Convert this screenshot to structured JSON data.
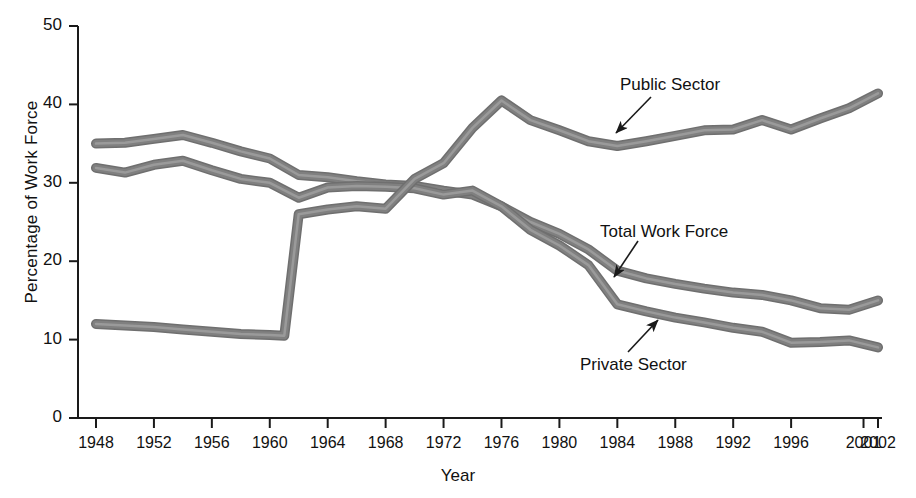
{
  "chart_data": {
    "type": "line",
    "title": "",
    "xlabel": "Year",
    "ylabel": "Percentage of Work Force",
    "ylim": [
      0,
      50
    ],
    "xlim": [
      1948,
      2002
    ],
    "yticks": [
      0,
      10,
      20,
      30,
      40,
      50
    ],
    "xticks": [
      1948,
      1952,
      1956,
      1960,
      1964,
      1968,
      1972,
      1976,
      1980,
      1984,
      1988,
      1992,
      1996,
      2001,
      2002
    ],
    "grid": false,
    "legend_position": "inline-annotations",
    "line_color": "#808080",
    "axis_color": "#1a1a1a",
    "series": [
      {
        "name": "Total Work Force",
        "x": [
          1948,
          1950,
          1952,
          1954,
          1956,
          1958,
          1960,
          1962,
          1964,
          1966,
          1968,
          1970,
          1972,
          1974,
          1976,
          1978,
          1980,
          1982,
          1984,
          1986,
          1988,
          1990,
          1992,
          1994,
          1996,
          1998,
          2000,
          2002
        ],
        "values": [
          35.0,
          35.1,
          35.6,
          36.1,
          35.1,
          34.0,
          33.1,
          31.0,
          30.7,
          30.2,
          29.8,
          29.6,
          29.0,
          28.5,
          27.0,
          25.0,
          23.5,
          21.5,
          18.8,
          17.8,
          17.1,
          16.5,
          16.0,
          15.7,
          15.0,
          14.0,
          13.8,
          15.0
        ]
      },
      {
        "name": "Private Sector",
        "x": [
          1948,
          1950,
          1952,
          1954,
          1956,
          1958,
          1960,
          1962,
          1964,
          1966,
          1968,
          1970,
          1972,
          1974,
          1976,
          1978,
          1980,
          1982,
          1984,
          1986,
          1988,
          1990,
          1992,
          1994,
          1996,
          1998,
          2000,
          2002
        ],
        "values": [
          31.9,
          31.3,
          32.3,
          32.8,
          31.6,
          30.5,
          30.0,
          28.1,
          29.4,
          29.6,
          29.5,
          29.3,
          28.5,
          29.0,
          27.0,
          24.0,
          22.0,
          19.5,
          14.5,
          13.6,
          12.8,
          12.2,
          11.5,
          11.0,
          9.6,
          9.7,
          9.9,
          9.0
        ]
      },
      {
        "name": "Public Sector",
        "x": [
          1948,
          1950,
          1952,
          1954,
          1956,
          1958,
          1960,
          1961,
          1962,
          1964,
          1966,
          1968,
          1970,
          1972,
          1974,
          1976,
          1978,
          1980,
          1982,
          1984,
          1986,
          1988,
          1990,
          1992,
          1994,
          1996,
          1998,
          2000,
          2002
        ],
        "values": [
          12.0,
          11.8,
          11.6,
          11.3,
          11.0,
          10.7,
          10.6,
          10.5,
          26.0,
          26.6,
          27.0,
          26.7,
          30.5,
          32.5,
          37.0,
          40.5,
          38.0,
          36.7,
          35.3,
          34.7,
          35.3,
          36.0,
          36.7,
          36.8,
          38.0,
          36.8,
          38.2,
          39.5,
          41.4
        ]
      }
    ],
    "annotations": [
      {
        "text": "Public Sector",
        "label_x": 620,
        "label_y": 75,
        "arrow_from_x": 651,
        "arrow_from_y": 97,
        "arrow_to_x": 616,
        "arrow_to_y": 133
      },
      {
        "text": "Total Work Force",
        "label_x": 600,
        "label_y": 222,
        "arrow_from_x": 638,
        "arrow_from_y": 241,
        "arrow_to_x": 614,
        "arrow_to_y": 277
      },
      {
        "text": "Private Sector",
        "label_x": 580,
        "label_y": 355,
        "arrow_from_x": 628,
        "arrow_from_y": 352,
        "arrow_to_x": 658,
        "arrow_to_y": 320
      }
    ]
  }
}
